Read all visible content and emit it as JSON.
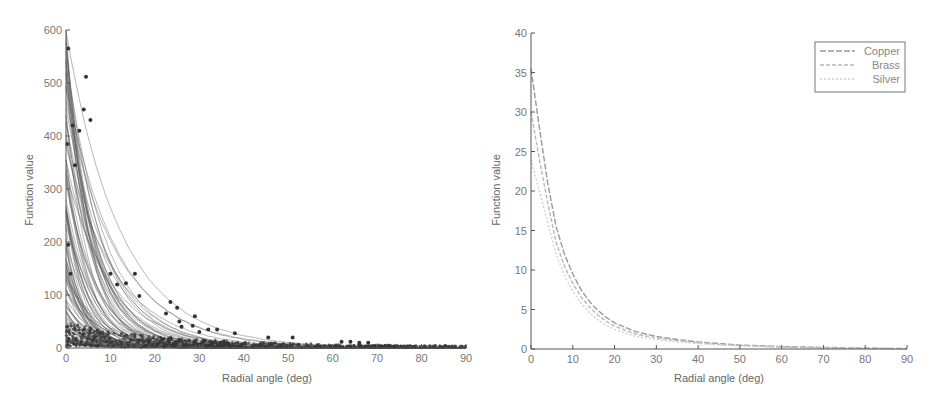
{
  "chart_data": [
    {
      "type": "line",
      "subtype": "line+scatter",
      "title": "",
      "xlabel": "Radial angle (deg)",
      "ylabel": "Function value",
      "xlim": [
        0,
        90
      ],
      "ylim": [
        0,
        600
      ],
      "xticks": [
        0,
        10,
        20,
        30,
        40,
        50,
        60,
        70,
        80,
        90
      ],
      "yticks": [
        0,
        100,
        200,
        300,
        400,
        500,
        600
      ],
      "grid": false,
      "legend": null,
      "description": "Many decaying fitted curves (dense gray band) with overlaid scattered measurement points",
      "curve_family": {
        "count_approx": 120,
        "start_values_range": [
          10,
          600
        ],
        "decay": "exponential-like toward 0 by ~40 deg"
      },
      "outlier_points": [
        {
          "x": 0.5,
          "y": 565
        },
        {
          "x": 4.5,
          "y": 512
        },
        {
          "x": 4,
          "y": 450
        },
        {
          "x": 5.5,
          "y": 430
        },
        {
          "x": 1.5,
          "y": 420
        },
        {
          "x": 3,
          "y": 410
        },
        {
          "x": 0.3,
          "y": 385
        },
        {
          "x": 2,
          "y": 345
        },
        {
          "x": 0.5,
          "y": 195
        },
        {
          "x": 1,
          "y": 140
        },
        {
          "x": 10,
          "y": 140
        },
        {
          "x": 15.5,
          "y": 140
        },
        {
          "x": 13.5,
          "y": 122
        },
        {
          "x": 11.5,
          "y": 120
        },
        {
          "x": 16.5,
          "y": 98
        },
        {
          "x": 23.5,
          "y": 87
        },
        {
          "x": 25,
          "y": 76
        },
        {
          "x": 22.5,
          "y": 65
        },
        {
          "x": 29,
          "y": 60
        },
        {
          "x": 25.5,
          "y": 50
        },
        {
          "x": 26,
          "y": 40
        },
        {
          "x": 30,
          "y": 30
        },
        {
          "x": 28.5,
          "y": 42
        },
        {
          "x": 32,
          "y": 35
        },
        {
          "x": 34,
          "y": 35
        },
        {
          "x": 38,
          "y": 28
        },
        {
          "x": 45.5,
          "y": 20
        },
        {
          "x": 51,
          "y": 20
        },
        {
          "x": 62,
          "y": 12
        },
        {
          "x": 64,
          "y": 12
        },
        {
          "x": 66,
          "y": 10
        },
        {
          "x": 68,
          "y": 10
        }
      ]
    },
    {
      "type": "line",
      "title": "",
      "xlabel": "Radial angle (deg)",
      "ylabel": "Function value",
      "xlim": [
        0,
        90
      ],
      "ylim": [
        0,
        40
      ],
      "xticks": [
        0,
        10,
        20,
        30,
        40,
        50,
        60,
        70,
        80,
        90
      ],
      "yticks": [
        0,
        5,
        10,
        15,
        20,
        25,
        30,
        35,
        40
      ],
      "grid": false,
      "legend": {
        "position": "upper right",
        "entries": [
          "Copper",
          "Brass",
          "Silver"
        ]
      },
      "x": [
        0,
        2,
        4,
        6,
        8,
        10,
        12,
        14,
        16,
        18,
        20,
        25,
        30,
        35,
        40,
        45,
        50,
        55,
        60,
        70,
        80,
        90
      ],
      "series": [
        {
          "name": "Copper",
          "color": "#9a9a9a",
          "values": [
            35.5,
            28,
            21,
            15.5,
            12,
            9.5,
            7.5,
            6,
            4.9,
            4,
            3.3,
            2.2,
            1.6,
            1.2,
            0.9,
            0.7,
            0.5,
            0.4,
            0.3,
            0.2,
            0.1,
            0.05
          ]
        },
        {
          "name": "Brass",
          "color": "#b8b8b8",
          "values": [
            30,
            24,
            18.5,
            13.5,
            10.5,
            8.3,
            6.6,
            5.3,
            4.3,
            3.5,
            2.9,
            1.9,
            1.4,
            1.05,
            0.8,
            0.6,
            0.45,
            0.35,
            0.25,
            0.15,
            0.08,
            0.04
          ]
        },
        {
          "name": "Silver",
          "color": "#cfcfcf",
          "values": [
            24,
            20,
            16,
            12,
            9.3,
            7.3,
            5.8,
            4.6,
            3.7,
            3.0,
            2.5,
            1.6,
            1.2,
            0.9,
            0.7,
            0.5,
            0.4,
            0.3,
            0.22,
            0.13,
            0.07,
            0.03
          ]
        }
      ]
    }
  ]
}
